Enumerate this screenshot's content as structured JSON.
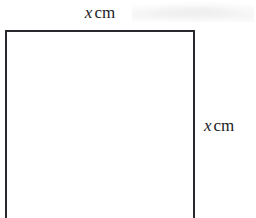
{
  "figure": {
    "kind": "geometry-diagram",
    "shape": "square",
    "background_color": "#ffffff",
    "stroke_color": "#2a2a2e",
    "stroke_width_px": 2,
    "bottom_edge_cropped": true
  },
  "labels": {
    "top": {
      "variable": "x",
      "unit": "cm",
      "full_text": "x cm",
      "position": "above-top-edge",
      "describes": "width"
    },
    "right": {
      "variable": "x",
      "unit": "cm",
      "full_text": "x cm",
      "position": "right-of-right-edge",
      "describes": "height"
    }
  }
}
